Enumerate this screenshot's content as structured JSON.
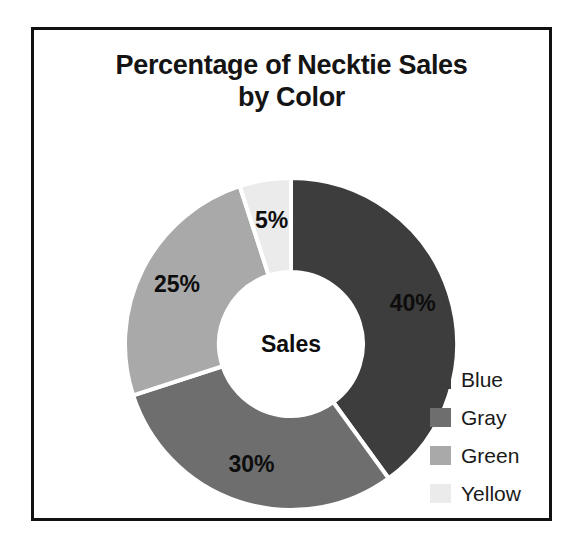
{
  "frame": {
    "border_color": "#111111"
  },
  "chart_data": {
    "type": "pie",
    "variant": "donut",
    "title": "Percentage of Necktie Sales by Color",
    "title_lines": [
      "Percentage of Necktie Sales",
      "by Color"
    ],
    "center_label": "Sales",
    "categories": [
      "Blue",
      "Gray",
      "Green",
      "Yellow"
    ],
    "values": [
      40,
      30,
      25,
      5
    ],
    "value_labels": [
      "40%",
      "30%",
      "25%",
      "5%"
    ],
    "colors": [
      "#3d3d3d",
      "#6e6e6e",
      "#a9a9a9",
      "#ebebeb"
    ],
    "slice_border_color": "#ffffff",
    "start_angle_deg": 0,
    "direction": "clockwise",
    "legend_position": "right",
    "legend_entries": [
      {
        "label": "Blue",
        "color": "#3d3d3d",
        "value": 40
      },
      {
        "label": "Gray",
        "color": "#6e6e6e",
        "value": 30
      },
      {
        "label": "Green",
        "color": "#a9a9a9",
        "value": 25
      },
      {
        "label": "Yellow",
        "color": "#ebebeb",
        "value": 5
      }
    ],
    "xlabel": "",
    "ylabel": "",
    "grid": false,
    "units": "percent",
    "total": 100
  },
  "geometry": {
    "cx": 257,
    "cy": 314,
    "outer_radius": 166,
    "inner_radius": 72,
    "label_radius": 128
  }
}
